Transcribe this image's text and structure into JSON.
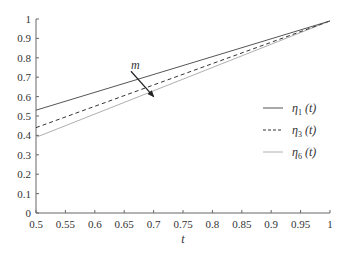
{
  "chart_data": {
    "type": "line",
    "title": "",
    "xlabel": "t",
    "ylabel": "",
    "xlim": [
      0.5,
      1.0
    ],
    "ylim": [
      0,
      1.0
    ],
    "grid": false,
    "legend_position": "right-center",
    "x_ticks": [
      "0.5",
      "0.55",
      "0.6",
      "0.65",
      "0.7",
      "0.75",
      "0.8",
      "0.85",
      "0.9",
      "0.95",
      "1"
    ],
    "y_ticks": [
      "0",
      "0.1",
      "0.2",
      "0.3",
      "0.4",
      "0.5",
      "0.6",
      "0.7",
      "0.8",
      "0.9",
      "1"
    ],
    "x": [
      0.5,
      1.0
    ],
    "series": [
      {
        "name": "η1 (t)",
        "label_base": "η",
        "label_sub": "1",
        "label_suffix": " (t)",
        "style": "solid",
        "color": "#555555",
        "values": [
          0.53,
          0.99
        ]
      },
      {
        "name": "η3 (t)",
        "label_base": "η",
        "label_sub": "3",
        "label_suffix": " (t)",
        "style": "dashed",
        "color": "#333333",
        "values": [
          0.44,
          0.99
        ]
      },
      {
        "name": "η6 (t)",
        "label_base": "η",
        "label_sub": "6",
        "label_suffix": " (t)",
        "style": "solid",
        "color": "#b0b0b0",
        "values": [
          0.39,
          0.99
        ]
      }
    ],
    "annotations": [
      {
        "text": "m",
        "type": "arrow",
        "meaning": "direction of increasing m",
        "from": [
          0.67,
          0.71
        ],
        "to": [
          0.7,
          0.6
        ]
      }
    ]
  }
}
